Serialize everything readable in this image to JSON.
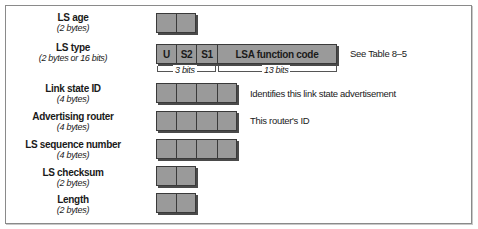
{
  "fields": [
    {
      "name": "LS age",
      "size": "(2 bytes)"
    },
    {
      "name": "LS type",
      "size": "(2 bytes or 16 bits)"
    },
    {
      "name": "Link state ID",
      "size": "(4 bytes)"
    },
    {
      "name": "Advertising router",
      "size": "(4 bytes)"
    },
    {
      "name": "LS sequence number",
      "size": "(4 bytes)"
    },
    {
      "name": "LS checksum",
      "size": "(2 bytes)"
    },
    {
      "name": "Length",
      "size": "(2 bytes)"
    }
  ],
  "ls_type_bits": {
    "cells": [
      "U",
      "S2",
      "S1",
      "LSA function code"
    ],
    "bracket_left": "3 bits",
    "bracket_right": "13 bits"
  },
  "notes": {
    "ls_type": "See Table 8–5",
    "link_state_id": "Identifies this link state advertisement",
    "advertising_router": "This router's ID"
  },
  "colors": {
    "cell_fill": "#9a9a9a",
    "cell_border": "#3a3a3a",
    "frame": "#8a8a8a"
  }
}
